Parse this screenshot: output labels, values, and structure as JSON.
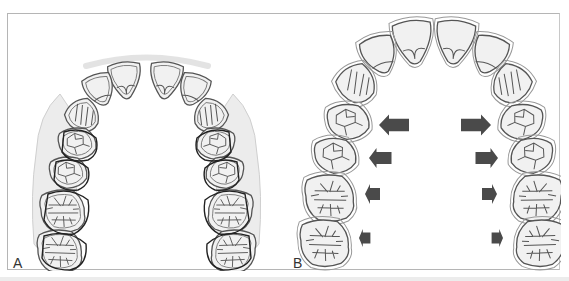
{
  "figure": {
    "panels": [
      {
        "id": "A",
        "label": "A",
        "description": "Maxillary arch with overlaid outlines (pre/post expansion comparison), shaded halo around posterior teeth"
      },
      {
        "id": "B",
        "label": "B",
        "description": "Maxillary arch with arrows showing lateral expansion; arrow size decreases from premolars to molars"
      }
    ],
    "colors": {
      "tooth_fill": "#f0f0f0",
      "tooth_outline": "#555555",
      "halo": "#e6e6e6",
      "arrow": "#4a4a4a",
      "frame": "#b5b5b5"
    },
    "arrows": {
      "left": [
        "large",
        "medium",
        "small",
        "smallest"
      ],
      "right": [
        "large",
        "medium",
        "small",
        "smallest"
      ]
    }
  }
}
